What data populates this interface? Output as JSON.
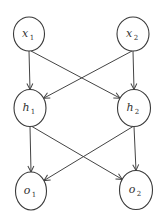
{
  "diagram": {
    "type": "neural-network",
    "colors": {
      "stroke": "#444444",
      "text": "#333333",
      "background": "#ffffff"
    },
    "nodes": [
      {
        "id": "x1",
        "base": "x",
        "sub": "1",
        "layer": "input"
      },
      {
        "id": "x2",
        "base": "x",
        "sub": "2",
        "layer": "input"
      },
      {
        "id": "h1",
        "base": "h",
        "sub": "1",
        "layer": "hidden"
      },
      {
        "id": "h2",
        "base": "h",
        "sub": "2",
        "layer": "hidden"
      },
      {
        "id": "o1",
        "base": "o",
        "sub": "1",
        "layer": "output"
      },
      {
        "id": "o2",
        "base": "o",
        "sub": "2",
        "layer": "output"
      }
    ],
    "edges": [
      {
        "from": "x1",
        "to": "h1"
      },
      {
        "from": "x1",
        "to": "h2"
      },
      {
        "from": "x2",
        "to": "h1"
      },
      {
        "from": "x2",
        "to": "h2"
      },
      {
        "from": "h1",
        "to": "o1"
      },
      {
        "from": "h1",
        "to": "o2"
      },
      {
        "from": "h2",
        "to": "o1"
      },
      {
        "from": "h2",
        "to": "o2"
      }
    ]
  }
}
